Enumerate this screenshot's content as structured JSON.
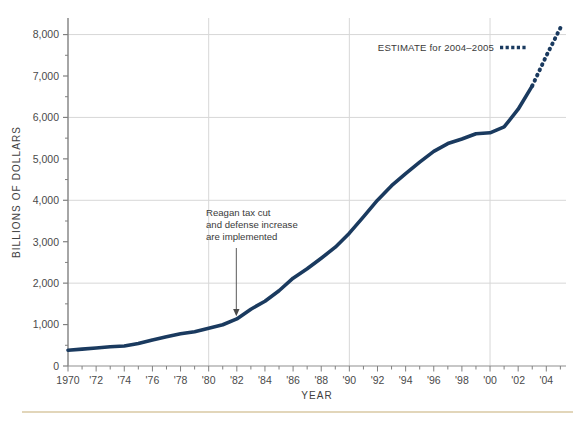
{
  "chart_data": {
    "type": "line",
    "title": "",
    "xlabel": "YEAR",
    "ylabel": "BILLIONS OF DOLLARS",
    "xlim": [
      1970,
      2005.4
    ],
    "ylim": [
      0,
      8400
    ],
    "grid": "major gridlines at y = 2,000 / 4,000 / 6,000 / 8,000 and x = 1980 / 1990 / 2000",
    "legend_position": "top-right inside plot",
    "y_ticks": [
      0,
      1000,
      2000,
      3000,
      4000,
      5000,
      6000,
      7000,
      8000
    ],
    "y_tick_labels": [
      "0",
      "1,000",
      "2,000",
      "3,000",
      "4,000",
      "5,000",
      "6,000",
      "7,000",
      "8,000"
    ],
    "y_minor_tick_step": 500,
    "x_ticks": [
      1970,
      1971,
      1972,
      1973,
      1974,
      1975,
      1976,
      1977,
      1978,
      1979,
      1980,
      1981,
      1982,
      1983,
      1984,
      1985,
      1986,
      1987,
      1988,
      1989,
      1990,
      1991,
      1992,
      1993,
      1994,
      1995,
      1996,
      1997,
      1998,
      1999,
      2000,
      2001,
      2002,
      2003,
      2004,
      2005
    ],
    "x_tick_labels": [
      "1970",
      "'72",
      "'74",
      "'76",
      "'78",
      "'80",
      "'82",
      "'84",
      "'86",
      "'88",
      "'90",
      "'92",
      "'94",
      "'96",
      "'98",
      "'00",
      "'02",
      "'04"
    ],
    "x_tick_label_years": [
      1970,
      1972,
      1974,
      1976,
      1978,
      1980,
      1982,
      1984,
      1986,
      1988,
      1990,
      1992,
      1994,
      1996,
      1998,
      2000,
      2002,
      2004
    ],
    "series": [
      {
        "name": "Gross federal debt (actual)",
        "style": "solid",
        "color": "#1a3a5f",
        "x": [
          1970,
          1971,
          1972,
          1973,
          1974,
          1975,
          1976,
          1977,
          1978,
          1979,
          1980,
          1981,
          1982,
          1983,
          1984,
          1985,
          1986,
          1987,
          1988,
          1989,
          1990,
          1991,
          1992,
          1993,
          1994,
          1995,
          1996,
          1997,
          1998,
          1999,
          2000,
          2001,
          2002,
          2003
        ],
        "values": [
          381,
          408,
          436,
          466,
          484,
          541,
          629,
          706,
          777,
          829,
          909,
          995,
          1137,
          1371,
          1564,
          1817,
          2120,
          2346,
          2601,
          2868,
          3206,
          3598,
          4002,
          4351,
          4643,
          4921,
          5181,
          5369,
          5478,
          5606,
          5629,
          5770,
          6198,
          6760
        ],
        "units": "billions of dollars"
      },
      {
        "name": "ESTIMATE for 2004–2005",
        "style": "dotted",
        "color": "#1a3a5f",
        "x": [
          2003,
          2004,
          2005
        ],
        "values": [
          6760,
          7486,
          8160
        ],
        "units": "billions of dollars"
      }
    ],
    "annotations": [
      {
        "name": "reagan-annotation",
        "lines": [
          "Reagan tax cut",
          "and defense increase",
          "are implemented"
        ],
        "arrow_target_year": 1982,
        "arrow_target_value": 1137
      }
    ],
    "legend": [
      {
        "label": "ESTIMATE for 2004–2005",
        "style": "dotted",
        "color": "#1a3a5f"
      }
    ],
    "colors": {
      "line": "#1a3a5f",
      "grid": "#d7d7d7",
      "axis": "#808080",
      "tick_text": "#4a4a4a",
      "bottom_rule": "#d9c9a3"
    }
  }
}
